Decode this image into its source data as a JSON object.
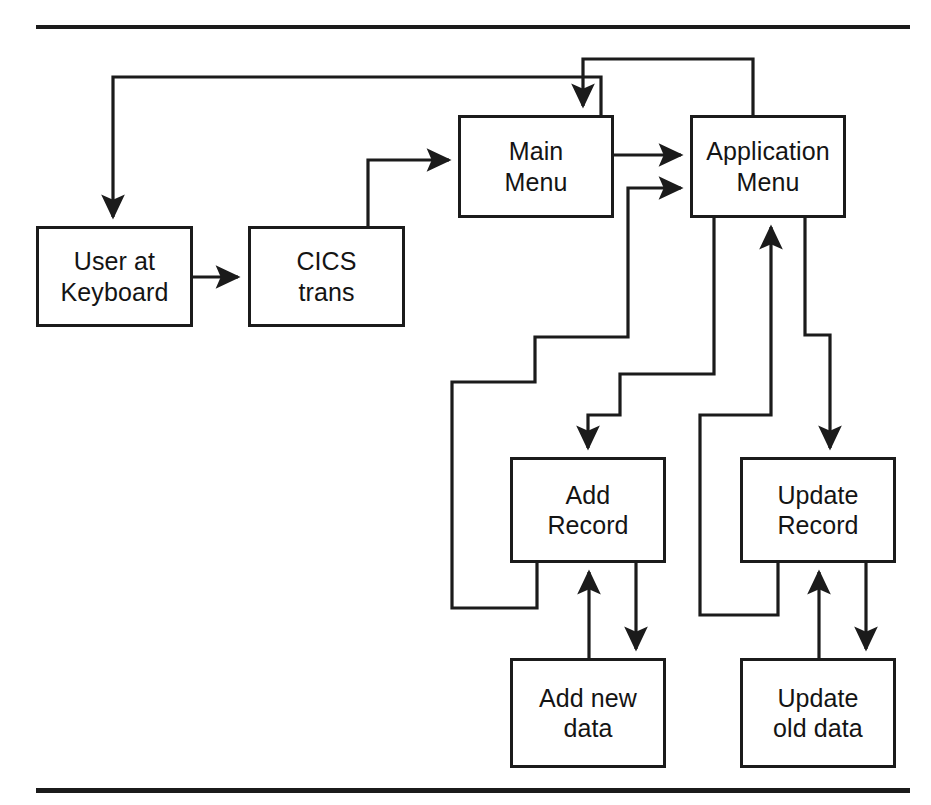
{
  "figure": {
    "kind": "flowchart",
    "title_text": "",
    "stroke_color": "#1b1b1b",
    "text_color": "#141414",
    "background_color": "#ffffff"
  },
  "rules": [
    {
      "name": "top-rule",
      "x": 36,
      "y": 25,
      "width": 874,
      "height": 4
    },
    {
      "name": "bottom-rule",
      "x": 36,
      "y": 788,
      "width": 874,
      "height": 5
    }
  ],
  "nodes": [
    {
      "id": "user-at-keyboard",
      "lines": [
        "User at",
        "Keyboard"
      ],
      "x": 36,
      "y": 226,
      "w": 157,
      "h": 101
    },
    {
      "id": "cics-trans",
      "lines": [
        "CICS",
        "trans"
      ],
      "x": 248,
      "y": 226,
      "w": 157,
      "h": 101
    },
    {
      "id": "main-menu",
      "lines": [
        "Main",
        "Menu"
      ],
      "x": 458,
      "y": 115,
      "w": 156,
      "h": 103
    },
    {
      "id": "application-menu",
      "lines": [
        "Application",
        "Menu"
      ],
      "x": 690,
      "y": 115,
      "w": 156,
      "h": 103
    },
    {
      "id": "add-record",
      "lines": [
        "Add",
        "Record"
      ],
      "x": 510,
      "y": 457,
      "w": 156,
      "h": 106
    },
    {
      "id": "update-record",
      "lines": [
        "Update",
        "Record"
      ],
      "x": 740,
      "y": 457,
      "w": 156,
      "h": 106
    },
    {
      "id": "add-new-data",
      "lines": [
        "Add new",
        "data"
      ],
      "x": 510,
      "y": 658,
      "w": 156,
      "h": 110
    },
    {
      "id": "update-old-data",
      "lines": [
        "Update",
        "old data"
      ],
      "x": 740,
      "y": 658,
      "w": 156,
      "h": 110
    }
  ],
  "edges": [
    {
      "id": "user-to-cics",
      "from": "user-at-keyboard",
      "to": "cics-trans",
      "arrow": true
    },
    {
      "id": "cics-to-main-menu",
      "from": "cics-trans",
      "to": "main-menu",
      "arrow": true
    },
    {
      "id": "main-menu-to-user",
      "from": "main-menu",
      "to": "user-at-keyboard",
      "arrow": true
    },
    {
      "id": "main-menu-to-application-menu",
      "from": "main-menu",
      "to": "application-menu",
      "arrow": true
    },
    {
      "id": "application-menu-to-main-menu",
      "from": "application-menu",
      "to": "main-menu",
      "arrow": true
    },
    {
      "id": "application-menu-to-add-record",
      "from": "application-menu",
      "to": "add-record",
      "arrow": true
    },
    {
      "id": "add-record-to-application-menu",
      "from": "add-record",
      "to": "application-menu",
      "arrow": true
    },
    {
      "id": "application-menu-to-update-record",
      "from": "application-menu",
      "to": "update-record",
      "arrow": true
    },
    {
      "id": "update-record-to-application-menu",
      "from": "update-record",
      "to": "application-menu",
      "arrow": true
    },
    {
      "id": "add-new-data-to-add-record",
      "from": "add-new-data",
      "to": "add-record",
      "arrow": true
    },
    {
      "id": "add-record-to-add-new-data",
      "from": "add-record",
      "to": "add-new-data",
      "arrow": true
    },
    {
      "id": "update-old-data-to-update-record",
      "from": "update-old-data",
      "to": "update-record",
      "arrow": true
    },
    {
      "id": "update-record-to-update-old-data",
      "from": "update-record",
      "to": "update-old-data",
      "arrow": true
    }
  ]
}
